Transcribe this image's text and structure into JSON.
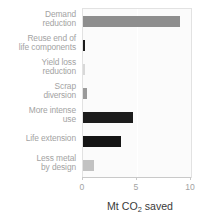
{
  "chart_data": {
    "type": "bar",
    "orientation": "horizontal",
    "title": "",
    "xlabel": "Mt CO2 saved",
    "xlabel_prefix": "Mt CO",
    "xlabel_sub": "2",
    "xlabel_suffix": " saved",
    "ylabel": "",
    "xlim": [
      0,
      10
    ],
    "ticks": [
      "0",
      "5",
      "10"
    ],
    "tick_values": [
      0,
      5,
      10
    ],
    "grid": true,
    "legend": "none",
    "categories": [
      "Demand reduction",
      "Reuse end of life components",
      "Yield loss reduction",
      "Scrap diversion",
      "More intense use",
      "Life extension",
      "Less metal by design"
    ],
    "category_lines": [
      [
        "Demand",
        "reduction"
      ],
      [
        "Reuse end of",
        "life components"
      ],
      [
        "Yield loss",
        "reduction"
      ],
      [
        "Scrap",
        "diversion"
      ],
      [
        "More intense",
        "use"
      ],
      [
        "Life extension"
      ],
      [
        "Less metal",
        "by design"
      ]
    ],
    "values": [
      9.0,
      0.2,
      0.15,
      0.35,
      4.6,
      3.5,
      1.0
    ],
    "bar_colors": [
      "#8e8e8e",
      "#1c1c1c",
      "#d8d8d8",
      "#9a9a9a",
      "#1c1c1c",
      "#151515",
      "#c2c2c2"
    ]
  },
  "style": {
    "plot_background": "#fbfbfb",
    "plot_border": "#e2e2e2",
    "gridline_color": "#ffffff",
    "label_color": "#a3a3a3",
    "axis_color": "#c9c9c9",
    "title_color": "#3a3a3a"
  }
}
